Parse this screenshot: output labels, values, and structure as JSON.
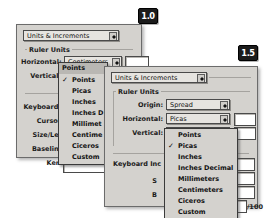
{
  "badges": [
    {
      "name": "version-badge-10",
      "label": "1.0"
    },
    {
      "name": "version-badge-15",
      "label": "1.5"
    }
  ],
  "window_v10": {
    "panel_popup": {
      "label": "Units & Increments",
      "icon": "updown-arrows-icon"
    },
    "group_label": "Ruler Units",
    "rows": [
      {
        "label": "Horizontal:",
        "value": "Centimeters"
      },
      {
        "label": "Vertical:",
        "value": "Points"
      }
    ],
    "section_labels": [
      "Keyboard I",
      "Cursor",
      "Size/Lea",
      "Baseline",
      "Ker"
    ],
    "open_menu": {
      "header": "Points",
      "checked": "Points",
      "items": [
        "Points",
        "Picas",
        "Inches",
        "Inches D",
        "Millimet",
        "Centime",
        "Ciceros",
        "Custom"
      ]
    }
  },
  "window_v15": {
    "panel_popup": {
      "label": "Units & Increments",
      "icon": "updown-arrows-icon"
    },
    "group_label": "Ruler Units",
    "rows": [
      {
        "label": "Origin:",
        "value": "Spread"
      },
      {
        "label": "Horizontal:",
        "value": "Picas"
      },
      {
        "label": "Vertical:",
        "value": "Picas"
      }
    ],
    "section_labels": [
      "Keyboard Inc",
      "S",
      "B"
    ],
    "suffix_label": "/100",
    "open_menu": {
      "checked": "Picas",
      "items": [
        "Points",
        "Picas",
        "Inches",
        "Inches Decimal",
        "Millimeters",
        "Centimeters",
        "Ciceros",
        "Custom"
      ]
    }
  },
  "colors": {
    "window_face": "#d4d2ce",
    "control_face": "#e6e4e0",
    "selected_face": "#b9b7b3",
    "field_white": "#ffffff",
    "border": "#4a4a4a",
    "badge_bg": "#1c1c1c",
    "badge_fg": "#ffffff"
  }
}
